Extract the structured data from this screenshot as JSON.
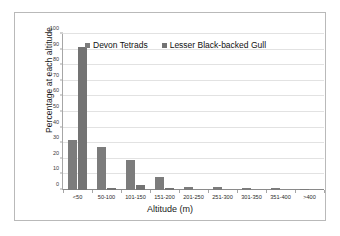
{
  "chart_data": {
    "type": "bar",
    "title": "",
    "xlabel": "Altitude (m)",
    "ylabel": "Percentage at each altitude",
    "categories": [
      "<50",
      "50-100",
      "101-150",
      "151-200",
      "201-250",
      "251-300",
      "301-350",
      "351-400",
      ">400"
    ],
    "series": [
      {
        "name": "Devon Tetrads",
        "color": "#7c7c7c",
        "values": [
          32,
          27.5,
          19.5,
          8.5,
          2,
          2,
          1.3,
          1,
          0.8
        ]
      },
      {
        "name": "Lesser Black-backed Gull",
        "color": "#737373",
        "values": [
          91.5,
          1.5,
          3.5,
          1.3,
          0,
          0,
          0,
          0,
          0
        ]
      }
    ],
    "ylim": [
      0,
      100
    ],
    "yticks": [
      0,
      10,
      20,
      30,
      40,
      50,
      60,
      70,
      80,
      90,
      100
    ],
    "ytick_labels": [
      "0",
      "10",
      "20",
      "30",
      "40",
      "50",
      "60",
      "70",
      "80",
      "90",
      "100"
    ],
    "grid": true,
    "legend_position": "top-center"
  }
}
